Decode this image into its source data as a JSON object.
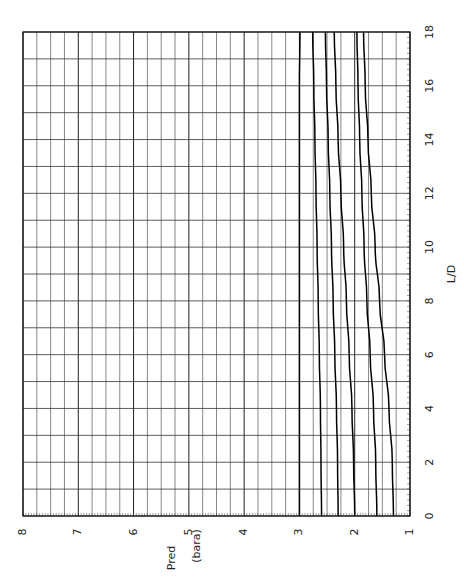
{
  "chart_data": {
    "type": "line",
    "title": "",
    "orientation": "rotated 90 degrees counter-clockwise (x-axis L/D runs vertically on right side, Pred axis along bottom)",
    "xlabel": "L/D",
    "ylabel": "Pred (bara)",
    "ylabel_parts": [
      "Pred",
      "(bara)"
    ],
    "xlim": [
      0,
      18
    ],
    "ylim": [
      1,
      8
    ],
    "x_ticks": [
      0,
      2,
      4,
      6,
      8,
      10,
      12,
      14,
      16,
      18
    ],
    "y_ticks": [
      1,
      2,
      3,
      4,
      5,
      6,
      7,
      8
    ],
    "grid": true,
    "x_grid_step": 1,
    "y_grid_step": 0.25,
    "legend": "none",
    "x": [
      0,
      2,
      4,
      6,
      8,
      10,
      12,
      14,
      16,
      18
    ],
    "series": [
      {
        "name": "curve-1",
        "values": [
          3.0,
          3.0,
          3.0,
          3.0,
          3.0,
          3.0,
          3.0,
          3.0,
          3.0,
          2.99
        ]
      },
      {
        "name": "curve-2",
        "values": [
          2.6,
          2.61,
          2.62,
          2.64,
          2.66,
          2.68,
          2.7,
          2.72,
          2.74,
          2.76
        ]
      },
      {
        "name": "curve-3",
        "values": [
          2.3,
          2.31,
          2.33,
          2.36,
          2.39,
          2.42,
          2.45,
          2.48,
          2.51,
          2.53
        ]
      },
      {
        "name": "curve-4",
        "values": [
          2.0,
          2.02,
          2.05,
          2.1,
          2.15,
          2.2,
          2.25,
          2.3,
          2.34,
          2.37
        ]
      },
      {
        "name": "curve-5",
        "values": [
          1.6,
          1.62,
          1.66,
          1.72,
          1.78,
          1.83,
          1.87,
          1.91,
          1.94,
          1.96
        ]
      },
      {
        "name": "curve-6",
        "values": [
          1.3,
          1.32,
          1.38,
          1.46,
          1.55,
          1.63,
          1.7,
          1.76,
          1.81,
          1.84
        ]
      }
    ]
  }
}
